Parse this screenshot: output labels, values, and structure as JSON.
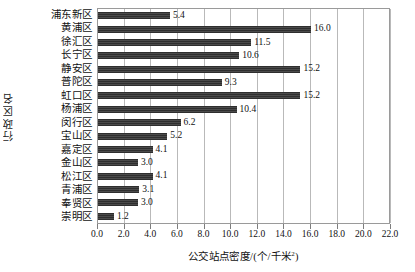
{
  "chart_data": {
    "type": "bar",
    "orientation": "horizontal",
    "title": "",
    "xlabel": "公交站点密度/(个/千米²)",
    "ylabel": "行政区名",
    "categories": [
      "浦东新区",
      "黄浦区",
      "徐汇区",
      "长宁区",
      "静安区",
      "普陀区",
      "虹口区",
      "杨浦区",
      "闵行区",
      "宝山区",
      "嘉定区",
      "金山区",
      "松江区",
      "青浦区",
      "奉贤区",
      "崇明区"
    ],
    "values": [
      5.4,
      16.0,
      11.5,
      10.6,
      15.2,
      9.3,
      15.2,
      10.4,
      6.2,
      5.2,
      4.1,
      3.0,
      4.1,
      3.1,
      3.0,
      1.2
    ],
    "value_labels": [
      "5.4",
      "16.0",
      "11.5",
      "10.6",
      "15.2",
      "9.3",
      "15.2",
      "10.4",
      "6.2",
      "5.2",
      "4.1",
      "3.0",
      "4.1",
      "3.1",
      "3.0",
      "1.2"
    ],
    "xlim": [
      0.0,
      22.0
    ],
    "xticks": [
      0.0,
      2.0,
      4.0,
      6.0,
      8.0,
      10.0,
      12.0,
      14.0,
      16.0,
      18.0,
      20.0,
      22.0
    ],
    "xtick_labels": [
      "0.0",
      "2.0",
      "4.0",
      "6.0",
      "8.0",
      "10.0",
      "12.0",
      "14.0",
      "16.0",
      "18.0",
      "20.0",
      "22.0"
    ],
    "grid": "vertical",
    "legend": null,
    "bar_color": "#3a3a3a",
    "grid_color": "#b9b9b9",
    "axis_color": "#9a9a9a"
  }
}
